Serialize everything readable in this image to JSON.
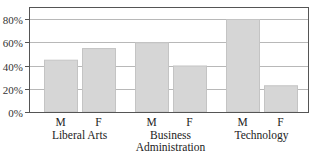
{
  "chart_data": {
    "type": "bar",
    "title": "",
    "xlabel": "",
    "ylabel": "",
    "ylim": [
      0,
      90
    ],
    "yticks": [
      0,
      20,
      40,
      60,
      80
    ],
    "ytick_labels": [
      "0%",
      "20%",
      "40%",
      "60%",
      "80%"
    ],
    "grid": true,
    "legend": "none",
    "categories": [
      "Liberal Arts",
      "Business Administration",
      "Technology"
    ],
    "category_label_lines": [
      [
        "Liberal Arts"
      ],
      [
        "Business",
        "Administration"
      ],
      [
        "Technology"
      ]
    ],
    "series": [
      {
        "name": "M",
        "values": [
          45,
          60,
          80
        ]
      },
      {
        "name": "F",
        "values": [
          55,
          40,
          23
        ]
      }
    ],
    "colors": {
      "bar_fill": "#d6d6d6",
      "bar_stroke": "#c4c4c4",
      "grid": "#b8b8b8",
      "axis": "#555555"
    }
  }
}
